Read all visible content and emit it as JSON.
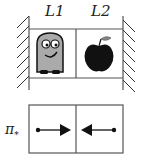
{
  "top_panel": {
    "labels": [
      "L1",
      "L2"
    ],
    "cells": [
      {
        "content": "robot-character"
      },
      {
        "content": "apple"
      }
    ]
  },
  "bottom_panel": {
    "label": "π",
    "label_subscript": "*",
    "cells": [
      {
        "arrow": "right"
      },
      {
        "arrow": "left"
      }
    ]
  }
}
